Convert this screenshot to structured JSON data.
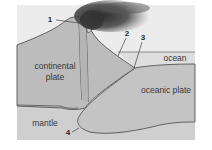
{
  "diagram": {
    "regions": {
      "continental_plate": {
        "line1": "continental",
        "line2": "plate"
      },
      "oceanic_plate": "oceanic plate",
      "ocean": "ocean",
      "mantle": "mantle"
    },
    "callouts": [
      {
        "number": "1"
      },
      {
        "number": "2"
      },
      {
        "number": "3"
      },
      {
        "number": "4"
      }
    ],
    "colors": {
      "sky": "#ececec",
      "continental": "#bcbcbc",
      "oceanic": "#c4c4c4",
      "ocean_water": "#dedede",
      "mantle": "#cfcfcf",
      "outline": "#555555",
      "plume": "#3a3a3a"
    }
  }
}
